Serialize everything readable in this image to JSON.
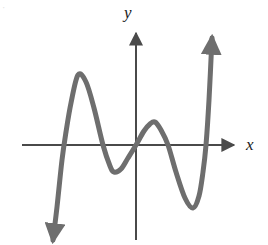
{
  "figure": {
    "kind": "cartesian-graph",
    "background_color": "#ffffff",
    "corner_mark": "·",
    "axis_color": "#4a4a4a",
    "curve_color": "#6e6e6e",
    "label_color": "#1a1a1a"
  },
  "axes": {
    "x_label": "x",
    "y_label": "y",
    "origin": {
      "x": 136,
      "y": 145
    },
    "x_axis": {
      "start_x": 22,
      "end_x": 238,
      "y": 145,
      "arrow": "right"
    },
    "y_axis": {
      "x": 136,
      "top_y": 28,
      "bottom_y": 240,
      "arrow": "up"
    },
    "ticks": [],
    "tick_labels": [],
    "grid": false
  },
  "chart_data": {
    "type": "line",
    "title": "",
    "subtitle": "",
    "xlabel": "x",
    "ylabel": "y",
    "grid": false,
    "legend": [],
    "legend_position": "none",
    "xlim": [
      22,
      238
    ],
    "ylim": [
      245,
      0
    ],
    "series": [
      {
        "name": "polynomial-curve",
        "color": "#6e6e6e",
        "stroke_width": 5,
        "start_arrow": "down-left",
        "end_arrow": "up-right",
        "description": "Odd-degree polynomial (degree 5) falling on the left and rising on the right, with four turning points.",
        "points_px": [
          [
            53,
            240
          ],
          [
            57,
            207
          ],
          [
            62,
            160
          ],
          [
            66,
            132
          ],
          [
            71,
            103
          ],
          [
            78,
            75
          ],
          [
            86,
            82
          ],
          [
            94,
            108
          ],
          [
            103,
            145
          ],
          [
            110,
            166
          ],
          [
            114,
            172
          ],
          [
            121,
            169
          ],
          [
            128,
            158
          ],
          [
            136,
            145
          ],
          [
            144,
            131
          ],
          [
            150,
            124
          ],
          [
            155,
            122
          ],
          [
            161,
            130
          ],
          [
            168,
            145
          ],
          [
            176,
            172
          ],
          [
            185,
            198
          ],
          [
            193,
            208
          ],
          [
            199,
            196
          ],
          [
            203,
            172
          ],
          [
            206,
            145
          ],
          [
            209,
            100
          ],
          [
            212,
            38
          ]
        ],
        "x_intercepts_px": [
          57,
          136,
          170,
          206
        ],
        "turning_points_px": [
          {
            "type": "local-maximum",
            "x": 78,
            "y": 75
          },
          {
            "type": "local-minimum",
            "x": 114,
            "y": 172
          },
          {
            "type": "local-maximum",
            "x": 155,
            "y": 122
          },
          {
            "type": "local-minimum",
            "x": 193,
            "y": 208
          }
        ]
      }
    ]
  }
}
